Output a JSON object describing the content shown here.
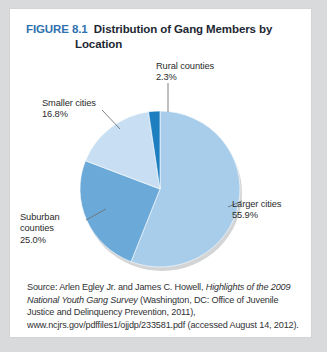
{
  "figure": {
    "number": "FIGURE 8.1",
    "title_line1": "Distribution of Gang Members by",
    "title_line2": "Location",
    "number_color": "#2f72b0",
    "title_color": "#1d2733"
  },
  "chart_data": {
    "type": "pie",
    "title": "Distribution of Gang Members by Location",
    "start_angle_deg": 0,
    "direction": "clockwise",
    "legend": "callout-labels",
    "categories": [
      "Larger cities",
      "Suburban counties",
      "Smaller cities",
      "Rural counties"
    ],
    "values": [
      55.9,
      25.0,
      16.8,
      2.3
    ],
    "value_suffix": "%",
    "colors": [
      "#a8cdeb",
      "#6aa9d8",
      "#c8dff3",
      "#1d7fc0"
    ],
    "slices": [
      {
        "label": "Larger cities",
        "value": 55.9,
        "value_text": "55.9%",
        "color": "#a8cdeb"
      },
      {
        "label": "Suburban counties",
        "value": 25.0,
        "value_text": "25.0%",
        "color": "#6aa9d8"
      },
      {
        "label": "Smaller cities",
        "value": 16.8,
        "value_text": "16.8%",
        "color": "#c8dff3"
      },
      {
        "label": "Rural counties",
        "value": 2.3,
        "value_text": "2.3%",
        "color": "#1d7fc0"
      }
    ]
  },
  "labels": {
    "rural": "Rural counties\n2.3%",
    "smaller": "Smaller cities\n16.8%",
    "suburban": "Suburban\ncounties\n25.0%",
    "larger": "Larger cities\n55.9%"
  },
  "source": {
    "prefix": "Source: Arlen Egley Jr. and James C. Howell, ",
    "italic_title": "Highlights of the 2009 National Youth Gang Survey",
    "suffix": " (Washington, DC: Office of Juvenile Justice and Delinquency Prevention, 2011), www.ncjrs.gov/pdffiles1/ojjdp/233581.pdf (accessed August 14, 2012)."
  }
}
